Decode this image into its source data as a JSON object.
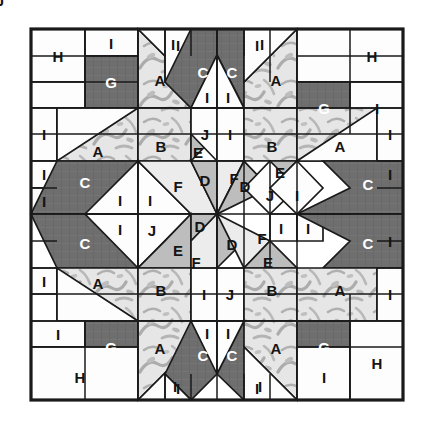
{
  "diagram": {
    "type": "quilt-block",
    "symmetry": "4-fold / 180-degree rotational",
    "grid": {
      "columns": 7,
      "rows": 7
    },
    "border": {
      "color": "#1a1a1a",
      "width": 3
    },
    "seam_line": {
      "color": "#1a1a1a",
      "width": 1.6
    }
  },
  "palette": {
    "background": "#ffffff",
    "white": "#fdfdfd",
    "light_gray": "#ececec",
    "medium_gray": "#bdbdbd",
    "dark_gray": "#6e6e6e",
    "print_light": "#e4e4e4",
    "print_motif": "#a9a9a9",
    "outline": "#1a1a1a",
    "label_on_dark": "#ffffff",
    "label_on_light": "#141414"
  },
  "legend": {
    "A": {
      "label": "A",
      "fabric": "print",
      "fill": "#e4e4e4"
    },
    "B": {
      "label": "B",
      "fabric": "print",
      "fill": "#e4e4e4"
    },
    "C": {
      "label": "C",
      "fabric": "dark",
      "fill": "#6e6e6e"
    },
    "D": {
      "label": "D",
      "fabric": "medium",
      "fill": "#bdbdbd"
    },
    "E": {
      "label": "E",
      "fabric": "medium",
      "fill": "#bdbdbd"
    },
    "F": {
      "label": "F",
      "fabric": "light",
      "fill": "#ececec"
    },
    "G": {
      "label": "G",
      "fabric": "dark",
      "fill": "#6e6e6e"
    },
    "H": {
      "label": "H",
      "fabric": "white",
      "fill": "#fdfdfd"
    },
    "I": {
      "label": "I",
      "fabric": "white",
      "fill": "#fdfdfd"
    },
    "J": {
      "label": "J",
      "fabric": "white",
      "fill": "#fdfdfd"
    }
  },
  "geometry": {
    "x": [
      31,
      85,
      138,
      165,
      191,
      217,
      244,
      270,
      297,
      350,
      403
    ],
    "y": [
      29,
      82,
      134,
      161,
      188,
      214,
      241,
      268,
      294,
      347,
      400
    ],
    "note": "x/y rails in screenshot pixel coordinates"
  },
  "pieces": {
    "labels_top_row": [
      "H",
      "I",
      "G",
      "A",
      "I",
      "I",
      "C",
      "C",
      "I",
      "I",
      "A",
      "G",
      "H",
      "I"
    ],
    "labels_center": [
      "D",
      "D",
      "D",
      "D",
      "F",
      "F",
      "F",
      "F"
    ],
    "labels_bottom_row": [
      "I",
      "G",
      "A",
      "C",
      "I",
      "I",
      "C",
      "A",
      "G",
      "I",
      "H",
      "H"
    ],
    "counts": {
      "A": 4,
      "B": 4,
      "C": 8,
      "D": 8,
      "E": 4,
      "F": 8,
      "G": 4,
      "H": 4,
      "I": 32,
      "J": 4
    }
  },
  "shapes": [
    {
      "name": "corner-H-tl",
      "letter": "H",
      "fill": "white",
      "pts": "31,29 85,29 85,82 31,82",
      "lx": 58,
      "ly": 56
    },
    {
      "name": "corner-I-tl",
      "letter": "I",
      "fill": "white",
      "pts": "85,29 138,29 138,56 85,56",
      "lx": 111,
      "ly": 43
    },
    {
      "name": "corner-G-tl",
      "letter": "G",
      "fill": "dark",
      "pts": "85,56 138,56 138,108 85,108",
      "lx": 111,
      "ly": 82
    },
    {
      "name": "corner-H-tl-lower",
      "letter": "",
      "fill": "white",
      "pts": "31,82 85,82 85,108 31,108",
      "lx": 0,
      "ly": 0
    },
    {
      "name": "star-A-top-left",
      "letter": "A",
      "fill": "print",
      "pts": "138,29 138,108 191,108 191,82",
      "lx": 160,
      "ly": 80
    },
    {
      "name": "star-I-top-left-tri",
      "letter": "I",
      "fill": "white",
      "pts": "138,29 191,82 191,29",
      "lx": 173,
      "ly": 44
    },
    {
      "name": "point-I-tl-strip",
      "letter": "I",
      "fill": "white",
      "pts": "165,29 191,29 191,82 165,82",
      "lx": 178,
      "ly": 45
    },
    {
      "name": "point-C-left",
      "letter": "C",
      "fill": "dark",
      "pts": "191,29 217,29 217,55 191,108 165,82",
      "lx": 203,
      "ly": 72
    },
    {
      "name": "point-C-right",
      "letter": "C",
      "fill": "dark",
      "pts": "217,29 244,29 270,82 244,108 217,55",
      "lx": 232,
      "ly": 72
    },
    {
      "name": "point-I-tr-strip",
      "letter": "I",
      "fill": "white",
      "pts": "244,29 270,29 270,82 244,82",
      "lx": 257,
      "ly": 45
    },
    {
      "name": "point-I-under-left",
      "letter": "I",
      "fill": "white",
      "pts": "191,108 217,55 217,108",
      "lx": 207,
      "ly": 97
    },
    {
      "name": "point-I-under-right",
      "letter": "I",
      "fill": "white",
      "pts": "217,55 244,108 217,108",
      "lx": 228,
      "ly": 97
    },
    {
      "name": "star-A-top-right",
      "letter": "A",
      "fill": "print",
      "pts": "297,29 297,108 244,108 244,82",
      "lx": 276,
      "ly": 80
    },
    {
      "name": "star-I-top-right-tri",
      "letter": "I",
      "fill": "white",
      "pts": "297,29 244,82 244,29",
      "lx": 262,
      "ly": 44
    },
    {
      "name": "corner-H-tr",
      "letter": "H",
      "fill": "white",
      "pts": "297,29 403,29 403,82 297,82",
      "lx": 372,
      "ly": 56
    },
    {
      "name": "corner-G-tr",
      "letter": "G",
      "fill": "dark",
      "pts": "297,82 350,82 350,134 297,134",
      "lx": 324,
      "ly": 108
    },
    {
      "name": "corner-I-tr",
      "letter": "I",
      "fill": "white",
      "pts": "350,82 403,82 403,134 350,134",
      "lx": 377,
      "ly": 108
    },
    {
      "name": "edge-I-left-1",
      "letter": "I",
      "fill": "white",
      "pts": "31,108 57,108 57,161 31,161",
      "lx": 44,
      "ly": 134
    },
    {
      "name": "row2-A-left",
      "letter": "A",
      "fill": "print",
      "pts": "57,108 138,108 138,161 57,161",
      "lx": 98,
      "ly": 151
    },
    {
      "name": "row2-A-left-tri",
      "letter": "",
      "fill": "white",
      "pts": "57,108 57,161 138,108",
      "lx": 0,
      "ly": 0
    },
    {
      "name": "row2-B-left",
      "letter": "B",
      "fill": "print",
      "pts": "138,108 191,108 191,161 138,161",
      "lx": 161,
      "ly": 146
    },
    {
      "name": "row2-E-left",
      "letter": "E",
      "fill": "medium",
      "pts": "191,134 217,134 191,161",
      "lx": 198,
      "ly": 152
    },
    {
      "name": "row2-J-left",
      "letter": "J",
      "fill": "white",
      "pts": "191,108 217,108 217,161 191,134",
      "lx": 205,
      "ly": 134
    },
    {
      "name": "row2-I-left-mid",
      "letter": "I",
      "fill": "white",
      "pts": "217,108 244,108 244,161 217,161",
      "lx": 230,
      "ly": 134
    },
    {
      "name": "row2-B-right",
      "letter": "B",
      "fill": "print",
      "pts": "244,108 297,108 297,161 244,161",
      "lx": 272,
      "ly": 146
    },
    {
      "name": "row2-A-right",
      "letter": "A",
      "fill": "print",
      "pts": "297,108 377,108 377,161 297,161",
      "lx": 340,
      "ly": 146
    },
    {
      "name": "row2-A-right-tri",
      "letter": "",
      "fill": "white",
      "pts": "377,108 377,161 297,161",
      "lx": 0,
      "ly": 0
    },
    {
      "name": "edge-I-right-1",
      "letter": "I",
      "fill": "white",
      "pts": "377,108 403,108 403,161 377,161",
      "lx": 390,
      "ly": 134
    },
    {
      "name": "edge-I-left-2",
      "letter": "I",
      "fill": "white",
      "pts": "31,161 57,161 57,188 31,188",
      "lx": 44,
      "ly": 174
    },
    {
      "name": "edge-I-left-3",
      "letter": "I",
      "fill": "white",
      "pts": "31,188 57,188 57,214 31,214",
      "lx": 44,
      "ly": 201
    },
    {
      "name": "arm-C-left-up",
      "letter": "C",
      "fill": "dark",
      "pts": "57,161 138,161 138,214 31,214 31,214",
      "lx": 85,
      "ly": 182
    },
    {
      "name": "arm-C-left-up-white",
      "letter": "I",
      "fill": "white",
      "pts": "85,214 138,161 138,214",
      "lx": 120,
      "ly": 200
    },
    {
      "name": "arm-I-left-up2",
      "letter": "I",
      "fill": "white",
      "pts": "138,161 191,214 138,214",
      "lx": 150,
      "ly": 200
    },
    {
      "name": "arm-F-left-up",
      "letter": "F",
      "fill": "light",
      "pts": "138,161 191,161 217,214 191,214",
      "lx": 178,
      "ly": 186
    },
    {
      "name": "arm-D-left-up",
      "letter": "D",
      "fill": "medium",
      "pts": "191,161 217,161 217,214",
      "lx": 205,
      "ly": 180
    },
    {
      "name": "ctr-F-n",
      "letter": "F",
      "fill": "light",
      "pts": "217,161 244,161 217,214",
      "lx": 234,
      "ly": 178
    },
    {
      "name": "ctr-D-ne",
      "letter": "D",
      "fill": "medium",
      "pts": "244,161 270,188 217,214",
      "lx": 245,
      "ly": 186
    },
    {
      "name": "ctr-E-ne",
      "letter": "E",
      "fill": "medium",
      "pts": "270,161 297,161 270,188",
      "lx": 280,
      "ly": 172
    },
    {
      "name": "ctr-J-ne",
      "letter": "J",
      "fill": "white",
      "pts": "270,161 270,188 244,161",
      "lx": 0,
      "ly": 0
    },
    {
      "name": "row3-J-right",
      "letter": "J",
      "fill": "white",
      "pts": "270,161 297,188 270,214 244,188",
      "lx": 270,
      "ly": 195
    },
    {
      "name": "row3-I-right",
      "letter": "I",
      "fill": "white",
      "pts": "297,161 323,188 297,214 270,188",
      "lx": 297,
      "ly": 195
    },
    {
      "name": "arm-C-right-up",
      "letter": "C",
      "fill": "dark",
      "pts": "323,161 403,161 403,214 297,214 350,188",
      "lx": 368,
      "ly": 184
    },
    {
      "name": "edge-I-right-2",
      "letter": "I",
      "fill": "white",
      "pts": "403,161 403,214",
      "lx": 390,
      "ly": 174
    },
    {
      "name": "arm-C-left-dn",
      "letter": "C",
      "fill": "dark",
      "pts": "31,214 138,214 138,268 57,268",
      "lx": 85,
      "ly": 243
    },
    {
      "name": "arm-I-left-dn",
      "letter": "I",
      "fill": "white",
      "pts": "85,214 138,214 138,268",
      "lx": 120,
      "ly": 229
    },
    {
      "name": "arm-J-left-dn",
      "letter": "J",
      "fill": "white",
      "pts": "138,214 191,214 138,268",
      "lx": 152,
      "ly": 230
    },
    {
      "name": "arm-E-left-dn",
      "letter": "E",
      "fill": "medium",
      "pts": "165,241 191,214 191,268 138,268",
      "lx": 178,
      "ly": 250
    },
    {
      "name": "arm-D-left-dn",
      "letter": "D",
      "fill": "medium",
      "pts": "191,214 217,214 191,241",
      "lx": 200,
      "ly": 226
    },
    {
      "name": "arm-F-left-dn",
      "letter": "F",
      "fill": "light",
      "pts": "191,241 217,214 217,268 191,294",
      "lx": 196,
      "ly": 262
    },
    {
      "name": "ctr-D-s",
      "letter": "D",
      "fill": "medium",
      "pts": "217,214 244,241 217,268",
      "lx": 232,
      "ly": 244
    },
    {
      "name": "ctr-F-se",
      "letter": "F",
      "fill": "light",
      "pts": "217,214 270,241 244,268",
      "lx": 262,
      "ly": 238
    },
    {
      "name": "ctr-E-se",
      "letter": "E",
      "fill": "medium",
      "pts": "244,268 270,241 297,268",
      "lx": 268,
      "ly": 262
    },
    {
      "name": "ctr-I-se1",
      "letter": "I",
      "fill": "white",
      "pts": "270,214 297,214 297,241 270,241",
      "lx": 281,
      "ly": 228
    },
    {
      "name": "ctr-I-se2",
      "letter": "I",
      "fill": "white",
      "pts": "297,214 323,214 323,241 297,241",
      "lx": 308,
      "ly": 228
    },
    {
      "name": "arm-C-right-dn",
      "letter": "C",
      "fill": "dark",
      "pts": "297,214 403,214 403,268 323,268 350,241",
      "lx": 368,
      "ly": 243
    },
    {
      "name": "edge-I-right-3",
      "letter": "I",
      "fill": "white",
      "pts": "403,214 403,268",
      "lx": 390,
      "ly": 241
    },
    {
      "name": "edge-I-left-4",
      "letter": "I",
      "fill": "white",
      "pts": "31,268 57,268 57,294 31,294",
      "lx": 44,
      "ly": 281
    },
    {
      "name": "row6-A-left",
      "letter": "A",
      "fill": "print",
      "pts": "57,268 138,268 138,321 57,321",
      "lx": 98,
      "ly": 283
    },
    {
      "name": "row6-A-left-tri",
      "letter": "",
      "fill": "white",
      "pts": "57,268 57,321 138,321",
      "lx": 0,
      "ly": 0
    },
    {
      "name": "row6-B-left",
      "letter": "B",
      "fill": "print",
      "pts": "138,268 191,268 191,321 138,321",
      "lx": 161,
      "ly": 290
    },
    {
      "name": "row6-I-left",
      "letter": "I",
      "fill": "white",
      "pts": "191,268 217,268 217,321 191,321",
      "lx": 204,
      "ly": 294
    },
    {
      "name": "row6-J-right",
      "letter": "J",
      "fill": "white",
      "pts": "217,268 244,268 244,321 217,321",
      "lx": 230,
      "ly": 294
    },
    {
      "name": "row6-B-right",
      "letter": "B",
      "fill": "print",
      "pts": "244,268 297,268 297,321 244,321",
      "lx": 272,
      "ly": 290
    },
    {
      "name": "row6-A-right",
      "letter": "A",
      "fill": "print",
      "pts": "297,268 377,268 377,321 297,321",
      "lx": 340,
      "ly": 290
    },
    {
      "name": "edge-I-right-4",
      "letter": "I",
      "fill": "white",
      "pts": "377,268 403,268 403,321 377,321",
      "lx": 390,
      "ly": 294
    },
    {
      "name": "corner-I-bl",
      "letter": "I",
      "fill": "white",
      "pts": "31,321 85,321 85,347 31,347",
      "lx": 58,
      "ly": 334
    },
    {
      "name": "corner-G-bl",
      "letter": "G",
      "fill": "dark",
      "pts": "85,321 138,321 138,373 85,373",
      "lx": 111,
      "ly": 347
    },
    {
      "name": "corner-H-bl",
      "letter": "H",
      "fill": "white",
      "pts": "31,347 138,347 138,400 31,400",
      "lx": 80,
      "ly": 377
    },
    {
      "name": "star-A-bot-left",
      "letter": "A",
      "fill": "print",
      "pts": "138,321 191,321 191,347 138,400",
      "lx": 160,
      "ly": 348
    },
    {
      "name": "star-I-bot-left-tri",
      "letter": "I",
      "fill": "white",
      "pts": "138,400 191,347 191,400",
      "lx": 175,
      "ly": 386
    },
    {
      "name": "point-C-bl",
      "letter": "C",
      "fill": "dark",
      "pts": "191,321 217,321 217,374 191,400 165,374",
      "lx": 203,
      "ly": 355
    },
    {
      "name": "point-C-br",
      "letter": "C",
      "fill": "dark",
      "pts": "217,321 244,321 270,374 244,400 217,374",
      "lx": 232,
      "ly": 355
    },
    {
      "name": "point-I-bl-strip",
      "letter": "I",
      "fill": "white",
      "pts": "165,374 191,400 165,400",
      "lx": 178,
      "ly": 388
    },
    {
      "name": "point-I-br-strip",
      "letter": "I",
      "fill": "white",
      "pts": "244,400 270,374 270,400",
      "lx": 257,
      "ly": 388
    },
    {
      "name": "point-I-abv-left",
      "letter": "I",
      "fill": "white",
      "pts": "191,321 217,321 217,374",
      "lx": 207,
      "ly": 333
    },
    {
      "name": "point-I-abv-right",
      "letter": "I",
      "fill": "white",
      "pts": "217,321 244,321 217,374",
      "lx": 228,
      "ly": 333
    },
    {
      "name": "star-A-bot-right",
      "letter": "A",
      "fill": "print",
      "pts": "297,321 244,321 244,347 297,400",
      "lx": 276,
      "ly": 348
    },
    {
      "name": "star-I-bot-right-tri",
      "letter": "I",
      "fill": "white",
      "pts": "297,400 244,347 244,400",
      "lx": 260,
      "ly": 386
    },
    {
      "name": "corner-G-br",
      "letter": "G",
      "fill": "dark",
      "pts": "297,321 350,321 350,373 297,373",
      "lx": 324,
      "ly": 347
    },
    {
      "name": "corner-I-br",
      "letter": "I",
      "fill": "white",
      "pts": "297,347 350,347 350,400 297,400",
      "lx": 324,
      "ly": 377
    },
    {
      "name": "corner-H-br",
      "letter": "H",
      "fill": "white",
      "pts": "350,321 403,321 403,400 350,400",
      "lx": 377,
      "ly": 363
    }
  ]
}
